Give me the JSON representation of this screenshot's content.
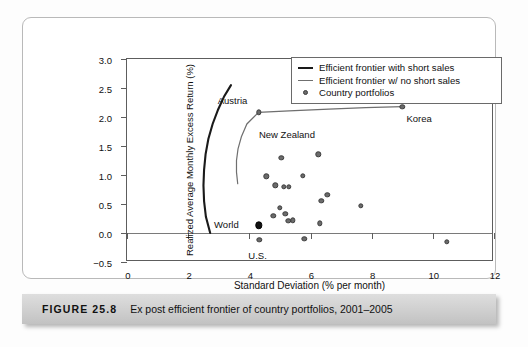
{
  "caption": {
    "figure_label": "FIGURE 25.8",
    "text": "Ex post efficient frontier of country portfolios, 2001–2005"
  },
  "legend": {
    "position": "top-right-inside",
    "entries": [
      {
        "label": "Efficient frontier with short sales",
        "marker": "line-thick",
        "color": "#1a1a1a"
      },
      {
        "label": "Efficient frontier w/ no short sales",
        "marker": "line-thin",
        "color": "#6f6f6f"
      },
      {
        "label": "Country portfolios",
        "marker": "dot",
        "color": "#6b6b6b"
      }
    ]
  },
  "chart_data": {
    "type": "scatter",
    "title": "Ex post efficient frontier of country portfolios, 2001–2005",
    "xlabel": "Standard Deviation (% per month)",
    "ylabel": "Realized Average Monthly Excess Return (%)",
    "xlim": [
      0,
      12
    ],
    "ylim": [
      -0.5,
      3.0
    ],
    "xticks": [
      0,
      2,
      4,
      6,
      8,
      10,
      12
    ],
    "yticks": [
      -0.5,
      0.0,
      0.5,
      1.0,
      1.5,
      2.0,
      2.5,
      3.0
    ],
    "xtick_labels": [
      "0",
      "2",
      "4",
      "6",
      "8",
      "10",
      "12"
    ],
    "ytick_labels": [
      "−0.5",
      "0.0",
      "0.5",
      "1.0",
      "1.5",
      "2.0",
      "2.5",
      "3.0"
    ],
    "grid": false,
    "zero_line": true,
    "series": [
      {
        "name": "Country portfolios",
        "type": "scatter",
        "marker": "circle",
        "color": "#6b6b6b",
        "points": [
          {
            "x": 4.3,
            "y": 2.08,
            "label": "Austria",
            "label_dx": -0.85,
            "label_dy": 0.22
          },
          {
            "x": 9.0,
            "y": 2.18,
            "label": "Korea",
            "label_dx": 0.55,
            "label_dy": -0.2
          },
          {
            "x": 5.05,
            "y": 1.3,
            "label": "New Zealand",
            "label_dx": 0.18,
            "label_dy": 0.4
          },
          {
            "x": 6.25,
            "y": 1.36
          },
          {
            "x": 4.55,
            "y": 0.98
          },
          {
            "x": 5.75,
            "y": 0.99
          },
          {
            "x": 4.85,
            "y": 0.82
          },
          {
            "x": 5.13,
            "y": 0.8
          },
          {
            "x": 5.3,
            "y": 0.8
          },
          {
            "x": 6.55,
            "y": 0.66
          },
          {
            "x": 6.35,
            "y": 0.55
          },
          {
            "x": 7.65,
            "y": 0.47
          },
          {
            "x": 5.0,
            "y": 0.43
          },
          {
            "x": 5.18,
            "y": 0.33
          },
          {
            "x": 4.78,
            "y": 0.3
          },
          {
            "x": 5.28,
            "y": 0.21
          },
          {
            "x": 5.43,
            "y": 0.22
          },
          {
            "x": 6.3,
            "y": 0.17
          },
          {
            "x": 4.3,
            "y": 0.13,
            "label": "World",
            "label_dx": -1.05,
            "label_dy": 0.02,
            "highlight": true
          },
          {
            "x": 4.32,
            "y": -0.12,
            "label": "U.S.",
            "label_dx": -0.05,
            "label_dy": -0.26
          },
          {
            "x": 5.8,
            "y": -0.1
          },
          {
            "x": 10.45,
            "y": -0.15
          }
        ]
      },
      {
        "name": "Efficient frontier with short sales",
        "type": "line",
        "color": "#1a1a1a",
        "width": 2.1,
        "x": [
          2.72,
          2.58,
          2.52,
          2.5,
          2.52,
          2.57,
          2.66,
          2.8,
          2.98,
          3.18,
          3.4
        ],
        "y": [
          0.0,
          0.28,
          0.55,
          0.82,
          1.09,
          1.36,
          1.62,
          1.88,
          2.13,
          2.36,
          2.55
        ]
      },
      {
        "name": "Efficient frontier w/ no short sales",
        "type": "line",
        "color": "#6f6f6f",
        "width": 1.2,
        "x": [
          3.62,
          3.58,
          3.58,
          3.63,
          3.74,
          3.92,
          4.3,
          5.3,
          6.6,
          7.8,
          9.0
        ],
        "y": [
          0.85,
          1.05,
          1.25,
          1.45,
          1.66,
          1.88,
          2.08,
          2.105,
          2.135,
          2.16,
          2.18
        ]
      }
    ]
  }
}
